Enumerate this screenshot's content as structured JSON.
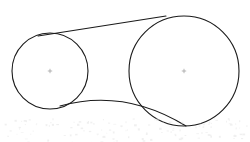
{
  "figure": {
    "kind": "geometry-diagram",
    "background_color": "#ffffff",
    "stroke_color": "#1a1a1a",
    "center_mark_color": "#9a9a9a",
    "stroke_width": 1.1,
    "canvas": {
      "width": 250,
      "height": 142
    },
    "shapes": {
      "small_circle": {
        "label": "small circle",
        "cx": 50,
        "cy": 71,
        "r": 38,
        "center_mark": true
      },
      "large_circle": {
        "label": "large circle",
        "cx": 184,
        "cy": 71,
        "r": 55,
        "center_mark": true
      },
      "upper_tangent_line": {
        "label": "upper tangent line",
        "x1": 38,
        "y1": 36,
        "x2": 166,
        "y2": 16
      },
      "lower_tangent_arc": {
        "label": "lower tangent arc",
        "x1": 60,
        "y1": 106,
        "cx": 124,
        "cy": 88,
        "x2": 186,
        "y2": 126
      }
    },
    "scan_artifact": {
      "label": "faint scanner speckle band",
      "color": "#e3e3e3",
      "region_y": 118,
      "region_height": 24
    }
  }
}
